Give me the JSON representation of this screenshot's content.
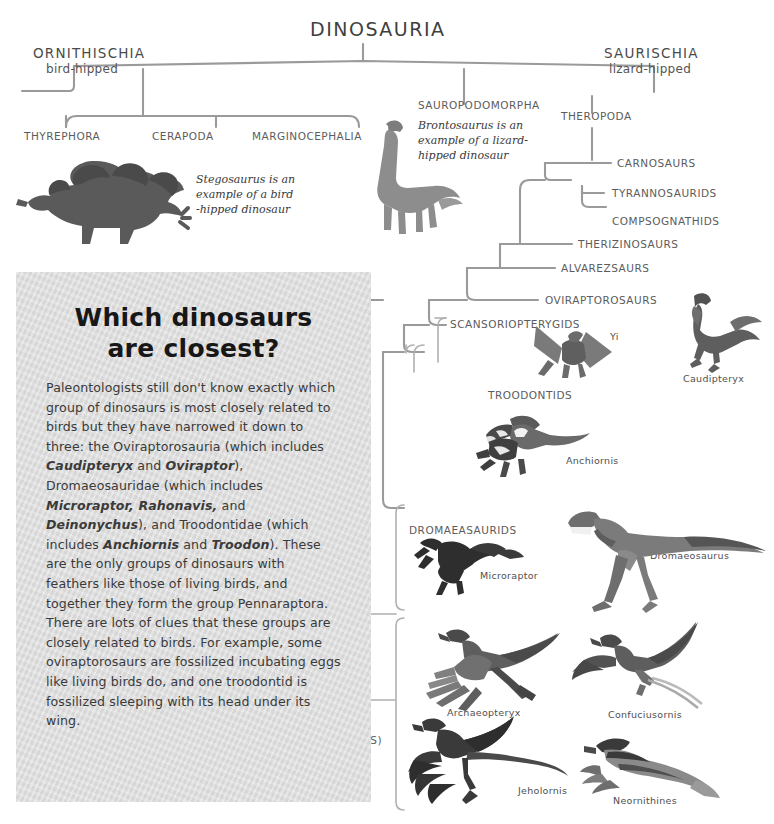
{
  "diagram": {
    "root": {
      "label": "DINOSAURIA"
    },
    "ornithischia": {
      "label": "ORNITHISCHIA",
      "sub": "bird-hipped"
    },
    "saurischia": {
      "label": "SAURISCHIA",
      "sub": "lizard-hipped"
    },
    "ornithischia_children": [
      {
        "label": "THYREPHORA"
      },
      {
        "label": "CERAPODA"
      },
      {
        "label": "MARGINOCEPHALIA"
      }
    ],
    "sauropodomorpha": {
      "label": "SAUROPODOMORPHA"
    },
    "theropoda": {
      "label": "THEROPODA"
    },
    "theropod_branches": [
      {
        "label": "CARNOSAURS"
      },
      {
        "label": "TYRANNOSAURIDS"
      },
      {
        "label": "COMPSOGNATHIDS"
      },
      {
        "label": "THERIZINOSAURS"
      },
      {
        "label": "ALVAREZSAURS"
      },
      {
        "label": "OVIRAPTOROSAURS"
      },
      {
        "label": "SCANSORIOPTERYGIDS"
      },
      {
        "label": "TROODONTIDS"
      },
      {
        "label": "DROMAEASAURIDS"
      }
    ],
    "aves": {
      "line1": "AVES",
      "line2": "(BIRDS)"
    },
    "notes": {
      "stegosaurus": "Stegosaurus is an example of a bird -hipped dinosaur",
      "brontosaurus": "Brontosaurus is an example of a lizard- hipped dinosaur"
    },
    "note_lines": {
      "stegosaurus": [
        "Stegosaurus is an",
        "example of a bird",
        "-hipped dinosaur"
      ],
      "brontosaurus": [
        "Brontosaurus is an",
        "example of a lizard-",
        "hipped dinosaur"
      ]
    },
    "specimens": [
      {
        "name": "Yi"
      },
      {
        "name": "Caudipteryx"
      },
      {
        "name": "Anchiornis"
      },
      {
        "name": "Microraptor"
      },
      {
        "name": "Dromaeosaurus"
      },
      {
        "name": "Archaeopteryx"
      },
      {
        "name": "Confuciusornis"
      },
      {
        "name": "Jeholornis"
      },
      {
        "name": "Neornithines"
      }
    ]
  },
  "panel": {
    "title_line1": "Which dinosaurs",
    "title_line2": "are closest?",
    "body_html": "Paleontologists still don't know exactly which group of dinosaurs is most closely related to birds but they have narrowed it down to three: the Oviraptorosauria (which includes <i>Caudipteryx</i> and <i>Oviraptor</i>), Dromaeosauridae (which includes <i>Microraptor, Rahonavis,</i> and <i>Deinonychus</i>), and Troodontidae (which includes <i>Anchiornis</i> and <i>Troodon</i>). These are the only groups of dinosaurs with feathers like those of living birds, and together they form the group Pennaraptora. There are lots of clues that these groups are closely related to birds. For example, some oviraptorosaurs are fossilized incubating eggs like living birds do, and one troodontid is fossilized sleeping with its head under its wing."
  },
  "colors": {
    "line": "#9a9a9a",
    "text": "#4a4a4a",
    "panel_bg": "#dcdcdc",
    "art_dark": "#4d4d4d",
    "art_mid": "#8a8a8a",
    "art_light": "#b4b4b4"
  }
}
